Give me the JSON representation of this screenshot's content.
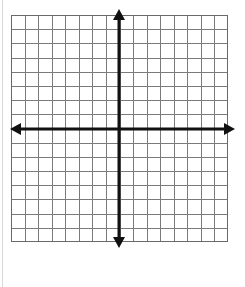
{
  "figure": {
    "kind": "cartesian-coordinate-plane",
    "background_color": "#ffffff"
  },
  "grid": {
    "columns": 16,
    "rows": 16,
    "cell_width_px": 13.56,
    "cell_height_px": 14.19,
    "line_color": "#7a7a7a",
    "line_width_px": 1,
    "border_color": "#6a6a6a",
    "border_width_px": 1,
    "left_px": 11,
    "top_px": 15,
    "width_px": 217,
    "height_px": 227,
    "fill_color": "#ffffff"
  },
  "axes": {
    "color": "#111111",
    "line_width_px": 3,
    "origin_x_px": 119,
    "origin_y_px": 129,
    "x_axis": {
      "label": "x-axis",
      "orientation": "horizontal",
      "start_px": 10,
      "end_px": 235,
      "arrowheads": "both",
      "tick_labels": [],
      "numbers_shown": false
    },
    "y_axis": {
      "label": "y-axis",
      "orientation": "vertical",
      "start_px": 9,
      "end_px": 248,
      "arrowheads": "both",
      "tick_labels": [],
      "numbers_shown": false
    }
  },
  "arrows": {
    "up": "arrow-up",
    "down": "arrow-down",
    "left": "arrow-left",
    "right": "arrow-right",
    "head_length_px": 11,
    "head_half_width_px": 6
  },
  "chart_data": {
    "type": "scatter",
    "title": "",
    "xlabel": "",
    "ylabel": "",
    "xlim": [
      -8,
      8
    ],
    "ylim": [
      -8,
      8
    ],
    "xticks": [
      -8,
      -7,
      -6,
      -5,
      -4,
      -3,
      -2,
      -1,
      0,
      1,
      2,
      3,
      4,
      5,
      6,
      7,
      8
    ],
    "yticks": [
      -8,
      -7,
      -6,
      -5,
      -4,
      -3,
      -2,
      -1,
      0,
      1,
      2,
      3,
      4,
      5,
      6,
      7,
      8
    ],
    "tick_labels_visible": false,
    "grid": true,
    "legend": false,
    "series": [
      {
        "name": "",
        "x": [],
        "y": []
      }
    ],
    "annotations": []
  }
}
